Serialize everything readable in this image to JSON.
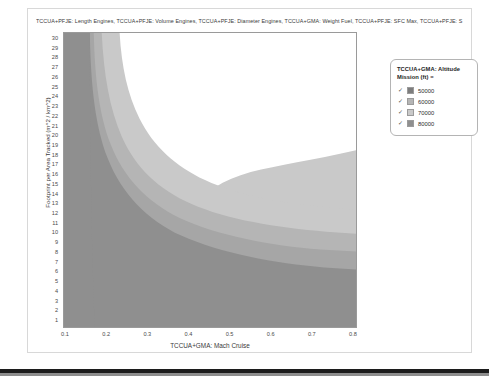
{
  "chart_title": "TCCUA+PFJE: Length Engines, TCCUA+PFJE: Volume Engines, TCCUA+PFJE: Diameter Engines, TCCUA+GMA: Weight Fuel, TCCUA+PFJE: SFC Max, TCCUA+PFJE: S",
  "legend": {
    "title": "TCCUA+GMA: Altitude Mission (ft) =",
    "check_glyph": "✓",
    "items": [
      {
        "label": "50000",
        "color": "#7d7d7d",
        "checked": true
      },
      {
        "label": "60000",
        "color": "#b5b5b5",
        "checked": true
      },
      {
        "label": "70000",
        "color": "#c9c9c9",
        "checked": true
      },
      {
        "label": "80000",
        "color": "#8f8f8f",
        "checked": true
      }
    ]
  },
  "chart_data": {
    "type": "contour",
    "title": "TCCUA+PFJE: Length Engines, TCCUA+PFJE: Volume Engines, TCCUA+PFJE: Diameter Engines, TCCUA+GMA: Weight Fuel, TCCUA+PFJE: SFC Max, TCCUA+PFJE: S",
    "xlabel": "TCCUA+GMA: Mach Cruise",
    "ylabel": "Footprint per Area Tracked (m^2 / km^2)",
    "xlim": [
      0.1,
      0.8
    ],
    "ylim": [
      0,
      30
    ],
    "xticks": [
      0.1,
      0.2,
      0.3,
      0.4,
      0.5,
      0.6,
      0.7,
      0.8
    ],
    "yticks": [
      1,
      2,
      3,
      4,
      5,
      6,
      7,
      8,
      9,
      10,
      11,
      12,
      13,
      14,
      15,
      16,
      17,
      18,
      19,
      20,
      21,
      22,
      23,
      24,
      25,
      26,
      27,
      28,
      29,
      30
    ],
    "grid": false,
    "legend_position": "right-outside",
    "legend_title": "TCCUA+GMA: Altitude Mission (ft) =",
    "series": [
      {
        "name": "50000",
        "color": "#7d7d7d"
      },
      {
        "name": "60000",
        "color": "#b5b5b5"
      },
      {
        "name": "70000",
        "color": "#c9c9c9"
      },
      {
        "name": "80000",
        "color": "#8f8f8f"
      }
    ],
    "regions": [
      {
        "name": "infeasible-background",
        "color": "#ffffff",
        "description": "Upper-right feasible/blank region above all altitude contours"
      },
      {
        "name": "altitude-70000-band",
        "color": "#c9c9c9",
        "description": "Light gray L-shaped band nearest the white region"
      },
      {
        "name": "altitude-60000-band",
        "color": "#b5b5b5",
        "description": "Mid-light gray L-shaped band"
      },
      {
        "name": "altitude-80000-band",
        "color": "#a6a6a6",
        "description": "Medium gray L-shaped band"
      },
      {
        "name": "altitude-50000-band",
        "color": "#8f8f8f",
        "description": "Darkest band occupying low Mach (left) and low footprint (bottom)"
      }
    ]
  },
  "axes": {
    "y": {
      "title": "Footprint per Area Tracked (m^2 / km^2)",
      "ticks": [
        "30",
        "29",
        "28",
        "27",
        "26",
        "25",
        "24",
        "23",
        "22",
        "21",
        "20",
        "19",
        "18",
        "17",
        "16",
        "15",
        "14",
        "13",
        "12",
        "11",
        "10",
        "9",
        "8",
        "7",
        "6",
        "5",
        "4",
        "3",
        "2",
        "1"
      ]
    },
    "x": {
      "title": "TCCUA+GMA: Mach Cruise",
      "ticks": [
        "0.1",
        "0.2",
        "0.3",
        "0.4",
        "0.5",
        "0.6",
        "0.7",
        "0.8"
      ]
    }
  }
}
